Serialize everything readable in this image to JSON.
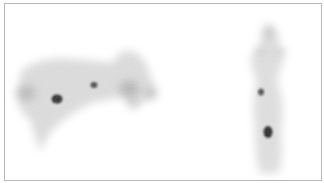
{
  "image": {
    "kind": "scintigraphy scan (two views, grayscale)",
    "border_color": "#b8b8b8",
    "background": "#ffffff",
    "views": [
      {
        "name": "lateral-view",
        "description": "diffuse horizontal body uptake with focal hot spots"
      },
      {
        "name": "frontal-view",
        "description": "vertical body uptake with two focal hot spots"
      }
    ],
    "hot_spots": [
      {
        "view": "lateral-view",
        "x": 56,
        "y": 98,
        "intensity": "high"
      },
      {
        "view": "lateral-view",
        "x": 93,
        "y": 84,
        "intensity": "medium"
      },
      {
        "view": "frontal-view",
        "x": 260,
        "y": 91,
        "intensity": "medium"
      },
      {
        "view": "frontal-view",
        "x": 267,
        "y": 131,
        "intensity": "high"
      }
    ]
  }
}
